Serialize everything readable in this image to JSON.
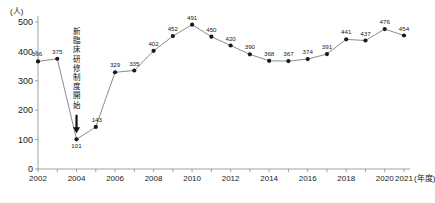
{
  "chart_data": {
    "type": "line",
    "title": "",
    "xlabel": "年度",
    "ylabel": "",
    "unit_label": "(人)",
    "x_unit_label": "(年度)",
    "grid": false,
    "legend": "none",
    "ylim": [
      0,
      500
    ],
    "yticks": [
      "0",
      "100",
      "200",
      "300",
      "400",
      "500"
    ],
    "xticks": [
      "2002",
      "2004",
      "2006",
      "2008",
      "2010",
      "2012",
      "2014",
      "2016",
      "2018",
      "2020",
      "2021"
    ],
    "categories": [
      "2002",
      "2003",
      "2004",
      "2005",
      "2006",
      "2007",
      "2008",
      "2009",
      "2010",
      "2011",
      "2012",
      "2013",
      "2014",
      "2015",
      "2016",
      "2017",
      "2018",
      "2019",
      "2020",
      "2021"
    ],
    "values": [
      366,
      375,
      101,
      143,
      329,
      335,
      402,
      452,
      491,
      450,
      420,
      390,
      368,
      367,
      374,
      391,
      441,
      437,
      476,
      454
    ],
    "point_labels": [
      "366",
      "375",
      "101",
      "143",
      "329",
      "335",
      "402",
      "452",
      "491",
      "450",
      "420",
      "390",
      "368",
      "367",
      "374",
      "391",
      "441",
      "437",
      "476",
      "454"
    ],
    "annotations": [
      {
        "text": "新臨床研修制度開始",
        "target_category": "2004",
        "target_value": 101,
        "orientation": "vertical",
        "arrow": "down"
      }
    ],
    "colors": {
      "line": "#6f6f6f",
      "marker": "#1a1a1a",
      "axis": "#888888",
      "text": "#1a1a1a",
      "background": "#ffffff"
    }
  }
}
